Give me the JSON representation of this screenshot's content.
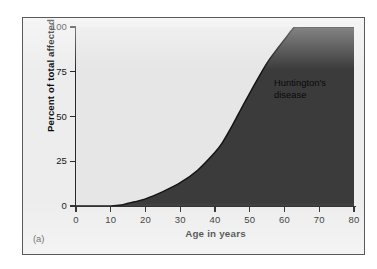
{
  "figure": {
    "panel_caption": "(a)",
    "frame_fill": "#ededed",
    "frame_border": "#5a5a5a"
  },
  "chart_data": {
    "type": "area",
    "title": "",
    "subtitle": "",
    "xlabel": "Age in years",
    "ylabel": "Percent of total affected",
    "xlim": [
      0,
      80
    ],
    "ylim": [
      0,
      100
    ],
    "grid": false,
    "legend_position": "none",
    "annotations": [
      {
        "text": "Huntington's\ndisease",
        "x": 57,
        "y": 72,
        "color": "#090909",
        "target_region": "below-curve"
      }
    ],
    "xticks": [
      0,
      10,
      20,
      30,
      40,
      50,
      60,
      70,
      80
    ],
    "xtick_labels": [
      "0",
      "10",
      "20",
      "30",
      "40",
      "50",
      "60",
      "70",
      "80"
    ],
    "yticks": [
      0,
      25,
      50,
      75,
      100
    ],
    "ytick_labels": [
      "0",
      "25",
      "50",
      "75",
      "100"
    ],
    "series": [
      {
        "name": "Huntington's disease cumulative onset",
        "curve": "sigmoid",
        "fill_below": "#3b3b3b",
        "fill_above": "#e6e6e6",
        "line_color": "#141414",
        "x": [
          0,
          5,
          10,
          13,
          15,
          20,
          25,
          30,
          35,
          40,
          42,
          45,
          48,
          50,
          52,
          55,
          58,
          60,
          62,
          63,
          65,
          70,
          75,
          80
        ],
        "y": [
          0,
          0,
          0,
          0.5,
          1.5,
          4,
          8,
          13,
          20,
          30,
          35,
          45,
          56,
          63,
          70,
          80,
          88,
          93,
          98,
          100,
          100,
          100,
          100,
          100
        ]
      }
    ]
  }
}
